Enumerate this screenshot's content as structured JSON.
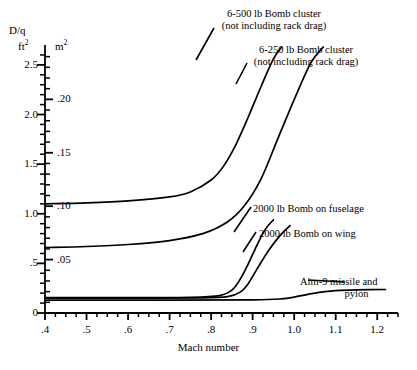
{
  "chart_data": {
    "type": "line",
    "title": "",
    "xlabel": "Mach number",
    "ylabel_left": "D/q ft²",
    "ylabel_right": "m²",
    "xlim": [
      0.4,
      1.25
    ],
    "ylim_left": [
      0,
      2.65
    ],
    "ylim_right": [
      0,
      0.2462
    ],
    "grid": false,
    "legend": "inline annotations",
    "xticks": [
      ".4",
      ".5",
      ".6",
      ".7",
      ".8",
      ".9",
      "1.0",
      "1.1",
      "1.2"
    ],
    "xtick_values": [
      0.4,
      0.5,
      0.6,
      0.7,
      0.8,
      0.9,
      1.0,
      1.1,
      1.2
    ],
    "yticks_left": [
      "0",
      ".5",
      "1.0",
      "1.5",
      "2.0",
      "2.5"
    ],
    "ytick_values_left": [
      0,
      0.5,
      1.0,
      1.5,
      2.0,
      2.5
    ],
    "yticks_right": [
      ".05",
      ".10",
      ".15",
      ".20"
    ],
    "ytick_values_right": [
      0.05,
      0.1,
      0.15,
      0.2
    ],
    "series": [
      {
        "name": "6-500 lb Bomb cluster (not including rack drag)",
        "x": [
          0.4,
          0.5,
          0.6,
          0.7,
          0.75,
          0.8,
          0.83,
          0.86,
          0.89,
          0.92,
          0.95,
          0.97
        ],
        "y": [
          1.1,
          1.11,
          1.13,
          1.17,
          1.22,
          1.34,
          1.48,
          1.7,
          1.98,
          2.28,
          2.56,
          2.68
        ]
      },
      {
        "name": "6-250 lb Bomb cluster (not including rack drag)",
        "x": [
          0.4,
          0.5,
          0.6,
          0.7,
          0.78,
          0.84,
          0.88,
          0.92,
          0.96,
          1.0,
          1.04,
          1.07
        ],
        "y": [
          0.66,
          0.67,
          0.69,
          0.73,
          0.8,
          0.92,
          1.08,
          1.35,
          1.75,
          2.15,
          2.52,
          2.68
        ]
      },
      {
        "name": "2000 lb Bomb on fuselage",
        "x": [
          0.4,
          0.6,
          0.75,
          0.82,
          0.85,
          0.87,
          0.89,
          0.91,
          0.93,
          0.95
        ],
        "y": [
          0.155,
          0.155,
          0.158,
          0.175,
          0.23,
          0.34,
          0.5,
          0.68,
          0.84,
          0.94
        ]
      },
      {
        "name": "2000 lb Bomb on wing",
        "x": [
          0.4,
          0.6,
          0.78,
          0.84,
          0.87,
          0.89,
          0.91,
          0.94,
          0.97,
          0.99
        ],
        "y": [
          0.15,
          0.15,
          0.152,
          0.165,
          0.21,
          0.3,
          0.44,
          0.64,
          0.8,
          0.88
        ]
      },
      {
        "name": "Aim-9 missile and pylon",
        "x": [
          0.4,
          0.7,
          0.9,
          0.97,
          1.0,
          1.03,
          1.06,
          1.1,
          1.15,
          1.22
        ],
        "y": [
          0.13,
          0.13,
          0.132,
          0.142,
          0.16,
          0.185,
          0.208,
          0.225,
          0.233,
          0.237
        ]
      }
    ]
  },
  "axis": {
    "left_title_top": "D/q",
    "left_title_unit": "ft",
    "left_unit_exp": "2",
    "right_title_unit": "m",
    "right_unit_exp": "2",
    "x_caption": "Mach number"
  },
  "annotations": {
    "bomb500_line1": "6-500 lb Bomb cluster",
    "bomb500_line2": "(not including rack drag)",
    "bomb250_line1": "6-250 lb Bomb cluster",
    "bomb250_line2": "(not including rack drag)",
    "fuselage": "2000 lb Bomb on fuselage",
    "wing": "2000 lb Bomb on wing",
    "aim9_line1": "Aim-9 missile and",
    "aim9_line2": "pylon"
  },
  "colors": {
    "ink": "#000000",
    "background": "#ffffff"
  }
}
